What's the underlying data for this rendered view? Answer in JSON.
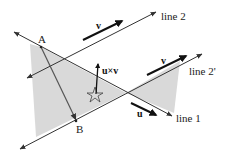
{
  "diagram": {
    "lines": [
      {
        "id": "line1",
        "label": "line 1"
      },
      {
        "id": "line2",
        "label": "line 2"
      },
      {
        "id": "line2prime",
        "label": "line 2'"
      }
    ],
    "points": [
      {
        "id": "A",
        "label": "A"
      },
      {
        "id": "B",
        "label": "B"
      }
    ],
    "vectors": [
      {
        "id": "v_on_line2",
        "label": "v"
      },
      {
        "id": "v_on_line2prime",
        "label": "v"
      },
      {
        "id": "u_on_line1",
        "label": "u"
      },
      {
        "id": "cross",
        "label": "u×v"
      }
    ],
    "colors": {
      "line": "#333333",
      "shade": "#d9d9d9",
      "vector": "#111111"
    }
  }
}
